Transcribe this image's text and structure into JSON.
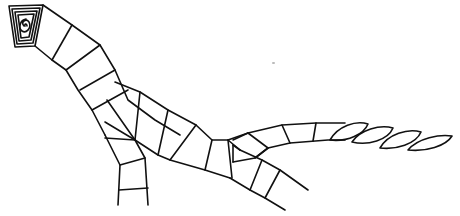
{
  "drawing": {
    "subject": "segmented dinosaur line drawing",
    "colors": {
      "background": "#ffffff",
      "stroke": "#111111",
      "speck": "#bbbbbb"
    }
  }
}
